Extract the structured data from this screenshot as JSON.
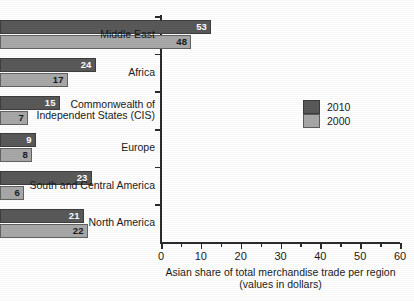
{
  "chart_data": {
    "type": "bar",
    "orientation": "horizontal",
    "grouped": true,
    "title": "",
    "xlabel_line1": "Asian share of total merchandise trade per region",
    "xlabel_line2": "(values in dollars)",
    "ylabel": "",
    "xlim": [
      0,
      60
    ],
    "xticks": [
      0,
      10,
      20,
      30,
      40,
      50,
      60
    ],
    "xtick_labels": [
      "0",
      "10",
      "20",
      "30",
      "40",
      "50",
      "60"
    ],
    "minor_tick_interval": 5,
    "grid": false,
    "legend_position": "middle-right",
    "categories": [
      "Middle East",
      "Africa",
      "Commonwealth of Independent States (CIS)",
      "Europe",
      "South and Central America",
      "North America"
    ],
    "category_label_lines": [
      [
        "Middle East"
      ],
      [
        "Africa"
      ],
      [
        "Commonwealth of",
        "Independent States (CIS)"
      ],
      [
        "Europe"
      ],
      [
        "South and Central America"
      ],
      [
        "North America"
      ]
    ],
    "series": [
      {
        "name": "2010",
        "color": "#595959",
        "label_color": "#ffffff",
        "values": [
          53,
          24,
          15,
          9,
          23,
          21
        ]
      },
      {
        "name": "2000",
        "color": "#a8a8a8",
        "label_color": "#1a1a1a",
        "values": [
          48,
          17,
          7,
          8,
          6,
          22
        ]
      }
    ],
    "data_labels": {
      "Middle East": {
        "2010": "53",
        "2000": "48"
      },
      "Africa": {
        "2010": "24",
        "2000": "17"
      },
      "Commonwealth of Independent States (CIS)": {
        "2010": "15",
        "2000": "7"
      },
      "Europe": {
        "2010": "9",
        "2000": "8"
      },
      "South and Central America": {
        "2010": "23",
        "2000": "6"
      },
      "North America": {
        "2010": "21",
        "2000": "22"
      }
    }
  },
  "legend": {
    "entries": [
      {
        "label": "2010",
        "color": "#595959"
      },
      {
        "label": "2000",
        "color": "#a8a8a8"
      }
    ]
  },
  "axis": {
    "x_title_line1": "Asian share of total merchandise trade per region",
    "x_title_line2": "(values in dollars)",
    "x_tick_labels": [
      "0",
      "10",
      "20",
      "30",
      "40",
      "50",
      "60"
    ]
  }
}
